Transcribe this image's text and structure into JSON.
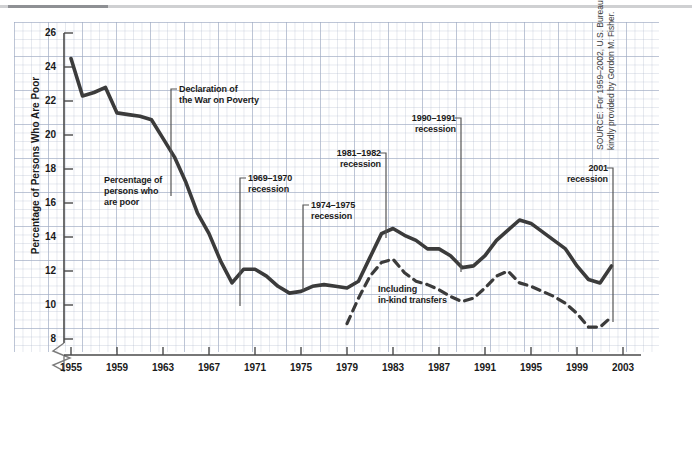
{
  "figure": {
    "y_axis_title": "Percentage of Persons Who Are Poor",
    "source_note": "SOURCE: For 1959–2002, U.S. Bureau of the Census. For 1955–1958, estimates kindly provided by Gordon M. Fisher."
  },
  "annotations": {
    "a1": {
      "line1": "Percentage of",
      "line2": "persons who",
      "line3": "are poor"
    },
    "a2": {
      "line1": "Declaration of",
      "line2": "the War on Poverty"
    },
    "a3": {
      "line1": "1969–1970",
      "line2": "recession"
    },
    "a4": {
      "line1": "1974–1975",
      "line2": "recession"
    },
    "a5": {
      "line1": "1981–1982",
      "line2": "recession"
    },
    "a6": {
      "line1": "1990–1991",
      "line2": "recession"
    },
    "a7": {
      "line1": "2001",
      "line2": "recession"
    },
    "a8": {
      "line1": "Including",
      "line2": "in-kind transfers"
    }
  },
  "chart_data": {
    "type": "line",
    "title": "",
    "xlabel": "",
    "ylabel": "Percentage of Persons Who Are Poor",
    "xlim": [
      1955,
      2003
    ],
    "ylim": [
      7,
      26
    ],
    "ytick_labels": [
      "26",
      "24",
      "22",
      "20",
      "18",
      "16",
      "14",
      "12",
      "10",
      "8"
    ],
    "ytick_values": [
      26,
      24,
      22,
      20,
      18,
      16,
      14,
      12,
      10,
      8
    ],
    "xtick_labels": [
      "1955",
      "1959",
      "1963",
      "1967",
      "1971",
      "1975",
      "1979",
      "1983",
      "1987",
      "1991",
      "1995",
      "1999",
      "2003"
    ],
    "xtick_values": [
      1955,
      1959,
      1963,
      1967,
      1971,
      1975,
      1979,
      1983,
      1987,
      1991,
      1995,
      1999,
      2003
    ],
    "axis_break": true,
    "grid": true,
    "legend_position": "inline-annotations",
    "series": [
      {
        "name": "Percentage of persons who are poor",
        "style": "solid",
        "color": "#3b3b3b",
        "x": [
          1955,
          1956,
          1957,
          1958,
          1959,
          1960,
          1961,
          1962,
          1963,
          1964,
          1965,
          1966,
          1967,
          1968,
          1969,
          1970,
          1971,
          1972,
          1973,
          1974,
          1975,
          1976,
          1977,
          1978,
          1979,
          1980,
          1981,
          1982,
          1983,
          1984,
          1985,
          1986,
          1987,
          1988,
          1989,
          1990,
          1991,
          1992,
          1993,
          1994,
          1995,
          1996,
          1997,
          1998,
          1999,
          2000,
          2001,
          2002
        ],
        "values": [
          24.5,
          22.3,
          22.5,
          22.8,
          21.3,
          21.2,
          21.1,
          20.9,
          19.8,
          18.7,
          17.2,
          15.4,
          14.2,
          12.6,
          11.3,
          12.1,
          12.1,
          11.7,
          11.1,
          10.7,
          10.8,
          11.1,
          11.2,
          11.1,
          11.0,
          11.4,
          12.8,
          14.2,
          14.5,
          14.1,
          13.8,
          13.3,
          13.3,
          12.9,
          12.2,
          12.3,
          12.9,
          13.8,
          14.4,
          15.0,
          14.8,
          14.3,
          13.8,
          13.3,
          12.3,
          11.5,
          11.3,
          12.3
        ]
      },
      {
        "name": "Including in-kind transfers",
        "style": "dashed",
        "color": "#3b3b3b",
        "x": [
          1979,
          1980,
          1981,
          1982,
          1983,
          1984,
          1985,
          1986,
          1987,
          1988,
          1989,
          1990,
          1991,
          1992,
          1993,
          1994,
          1995,
          1996,
          1997,
          1998,
          1999,
          2000,
          2001,
          2002
        ],
        "values": [
          8.9,
          10.4,
          11.7,
          12.5,
          12.7,
          11.9,
          11.4,
          11.2,
          10.9,
          10.5,
          10.2,
          10.4,
          11.0,
          11.7,
          12.0,
          11.3,
          11.1,
          10.8,
          10.5,
          10.1,
          9.5,
          8.7,
          8.7,
          9.3
        ]
      }
    ]
  }
}
